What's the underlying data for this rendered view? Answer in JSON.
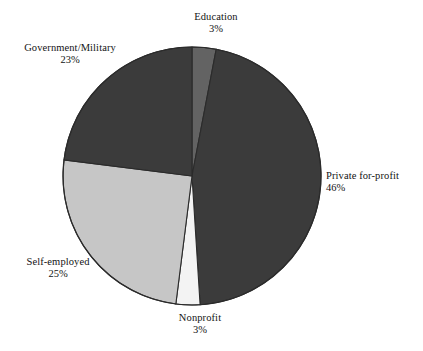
{
  "chart_data": {
    "type": "pie",
    "title": "",
    "subtitle": "",
    "xlabel": "",
    "ylabel": "",
    "grid": false,
    "legend_position": "none",
    "label_format": "category name above percentage",
    "start_angle_deg": 0,
    "direction": "clockwise",
    "categories": [
      "Education",
      "Private for-profit",
      "Nonprofit",
      "Self-employed",
      "Government/Military"
    ],
    "values": [
      3,
      46,
      3,
      25,
      23
    ],
    "units": "percent",
    "slices": [
      {
        "label": "Education",
        "value": 3,
        "value_text": "3%",
        "color": "#636363",
        "start_deg": 0,
        "end_deg": 10.8
      },
      {
        "label": "Private for-profit",
        "value": 46,
        "value_text": "46%",
        "color": "#3b3b3b",
        "start_deg": 10.8,
        "end_deg": 176.4
      },
      {
        "label": "Nonprofit",
        "value": 3,
        "value_text": "3%",
        "color": "#f3f3f3",
        "start_deg": 176.4,
        "end_deg": 187.2
      },
      {
        "label": "Self-employed",
        "value": 25,
        "value_text": "25%",
        "color": "#c6c6c6",
        "start_deg": 187.2,
        "end_deg": 277.2
      },
      {
        "label": "Government/Military",
        "value": 23,
        "value_text": "23%",
        "color": "#3b3b3b",
        "start_deg": 277.2,
        "end_deg": 360
      }
    ]
  },
  "labels": {
    "education": {
      "category": "Education",
      "value": "3%"
    },
    "government": {
      "category": "Government/Military",
      "value": "23%"
    },
    "private": {
      "category": "Private for-profit",
      "value": "46%"
    },
    "selfemployed": {
      "category": "Self-employed",
      "value": "25%"
    },
    "nonprofit": {
      "category": "Nonprofit",
      "value": "3%"
    }
  },
  "style": {
    "background": "#ffffff",
    "outline": "#2b2b2b",
    "text": "#131313"
  }
}
